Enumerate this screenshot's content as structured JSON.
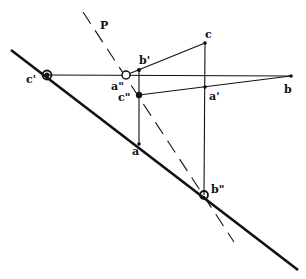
{
  "diagram": {
    "labels": {
      "P": "P",
      "c": "c",
      "b_prime": "b'",
      "a_dprime": "a\"",
      "c_prime": "c'",
      "c_dprime": "c\"",
      "a_prime": "a'",
      "b": "b",
      "a": "a",
      "b_dprime": "b\""
    },
    "colors": {
      "line": "#111111",
      "background": "#ffffff"
    },
    "points": {
      "c_prime": [
        47,
        75
      ],
      "a_dprime": [
        126,
        75
      ],
      "b_prime": [
        139,
        70
      ],
      "c": [
        205,
        43
      ],
      "c_dprime": [
        139,
        95
      ],
      "a_prime": [
        205,
        87
      ],
      "b": [
        291,
        76
      ],
      "a": [
        139,
        144
      ],
      "b_dprime": [
        204,
        195
      ]
    },
    "lines": {
      "thick_trace": {
        "from": [
          11,
          50
        ],
        "to": [
          298,
          270
        ]
      },
      "dashed_P": {
        "from": [
          83,
          12
        ],
        "to": [
          234,
          242
        ]
      }
    }
  }
}
